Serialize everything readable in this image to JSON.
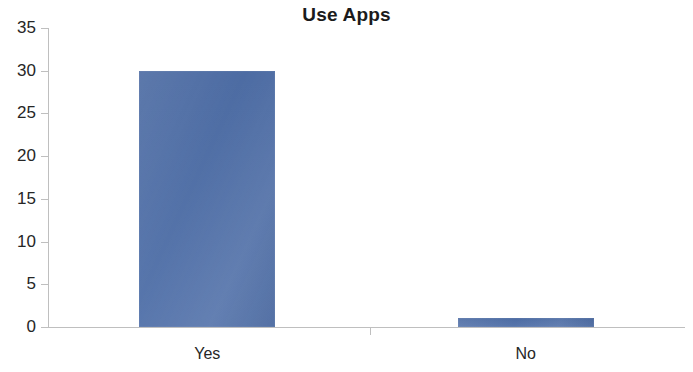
{
  "chart_data": {
    "type": "bar",
    "title": "Use Apps",
    "xlabel": "",
    "ylabel": "",
    "categories": [
      "Yes",
      "No"
    ],
    "values": [
      30,
      1
    ],
    "ylim": [
      0,
      35
    ],
    "y_ticks": [
      0,
      5,
      10,
      15,
      20,
      25,
      30,
      35
    ],
    "y_tick_labels": [
      "0",
      "5",
      "10",
      "15",
      "20",
      "25",
      "30",
      "35"
    ],
    "grid": false,
    "legend": false,
    "legend_position": "none",
    "series": [
      {
        "name": "Use Apps",
        "values": [
          30,
          1
        ],
        "color": "#4f6fa8"
      }
    ],
    "colors": {
      "bar_fill": "#4f6fa8",
      "axis_line": "#bfbfbf",
      "text": "#262626",
      "title_text": "#1b1b1b",
      "background": "#ffffff"
    }
  }
}
